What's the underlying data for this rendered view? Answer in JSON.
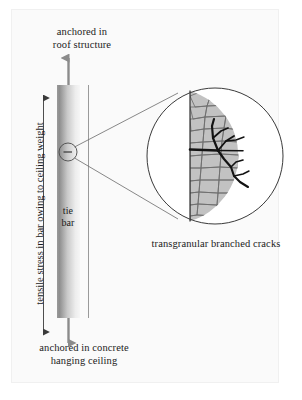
{
  "figure": {
    "labels": {
      "top_anchor": "anchored in\nroof structure",
      "bottom_anchor": "anchored in concrete\nhanging ceiling",
      "bar": "tie\nbar",
      "stress": "tensile stress in bar owing to ceiling weight",
      "caption": "transgranular branched cracks"
    },
    "colors": {
      "ink": "#1a1a1a",
      "line": "#4a4a4a",
      "bar_dark": "#8f8f8f",
      "bar_light": "#f2f2f2",
      "grain_fill": "#bdbdbd",
      "grain_line": "#6e6e6e",
      "crack": "#111111",
      "background": "#ffffff",
      "panel": "#fafafa"
    },
    "geometry": {
      "bar_x": 57,
      "bar_width": 23,
      "bar_top": 85,
      "bar_bottom": 318,
      "detail_circle_cx": 68,
      "detail_circle_cy": 152,
      "detail_circle_r": 9,
      "magnified_circle_cx": 215,
      "magnified_circle_cy": 156,
      "magnified_circle_r": 68,
      "divider_x": 190
    }
  }
}
